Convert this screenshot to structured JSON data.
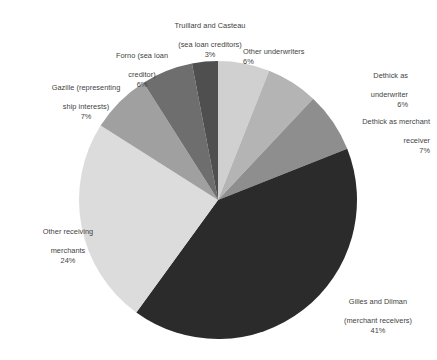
{
  "chart_data": {
    "type": "pie",
    "title": "",
    "subtitle": "",
    "xlabel": "",
    "ylabel": "",
    "legend_position": "none",
    "grid": false,
    "labels_outside": true,
    "start_angle_deg": 0,
    "direction": "clockwise",
    "categories": [
      "Other underwriters",
      "Dethick as underwriter",
      "Dethick as merchant receiver",
      "Gilles and Dilman (merchant receivers)",
      "Other receiving merchants",
      "Gazille (representing ship interests)",
      "Forno (sea loan creditor)",
      "Truillard and Casteau (sea loan creditors)"
    ],
    "values": [
      6,
      6,
      7,
      41,
      24,
      7,
      6,
      3
    ],
    "value_labels": [
      "6%",
      "6%",
      "7%",
      "41%",
      "24%",
      "7%",
      "6%",
      "3%"
    ],
    "colors": [
      "#d0d0d0",
      "#b4b4b4",
      "#8e8e8e",
      "#2b2b2b",
      "#dcdcdc",
      "#a0a0a0",
      "#6e6e6e",
      "#4f4f4f"
    ]
  },
  "slices": [
    {
      "id": "other-underwriters",
      "name": "Other underwriters",
      "line1": "Other underwriters",
      "line2": "",
      "pct": "6%",
      "value": 6,
      "color": "#d0d0d0"
    },
    {
      "id": "dethick-underwriter",
      "name": "Dethick as underwriter",
      "line1": "Dethick as",
      "line2": "underwriter",
      "pct": "6%",
      "value": 6,
      "color": "#b4b4b4"
    },
    {
      "id": "dethick-merchant-receiver",
      "name": "Dethick as merchant receiver",
      "line1": "Dethick as merchant",
      "line2": "receiver",
      "pct": "7%",
      "value": 7,
      "color": "#8e8e8e"
    },
    {
      "id": "gilles-and-dilman",
      "name": "Gilles and Dilman (merchant receivers)",
      "line1": "Gilles and Dilman",
      "line2": "(merchant receivers)",
      "pct": "41%",
      "value": 41,
      "color": "#2b2b2b"
    },
    {
      "id": "other-receiving-merchants",
      "name": "Other receiving merchants",
      "line1": "Other receiving",
      "line2": "merchants",
      "pct": "24%",
      "value": 24,
      "color": "#dcdcdc"
    },
    {
      "id": "gazille",
      "name": "Gazille (representing ship interests)",
      "line1": "Gazille (representing",
      "line2": "ship interests)",
      "pct": "7%",
      "value": 7,
      "color": "#a0a0a0"
    },
    {
      "id": "forno",
      "name": "Forno (sea loan creditor)",
      "line1": "Forno (sea loan",
      "line2": "creditor)",
      "pct": "6%",
      "value": 6,
      "color": "#6e6e6e"
    },
    {
      "id": "truillard-and-casteau",
      "name": "Truillard and Casteau (sea loan creditors)",
      "line1": "Truillard and Casteau",
      "line2": "(sea loan creditors)",
      "pct": "3%",
      "value": 3,
      "color": "#4f4f4f"
    }
  ],
  "geometry": {
    "cx": 218,
    "cy": 200,
    "r": 139
  }
}
